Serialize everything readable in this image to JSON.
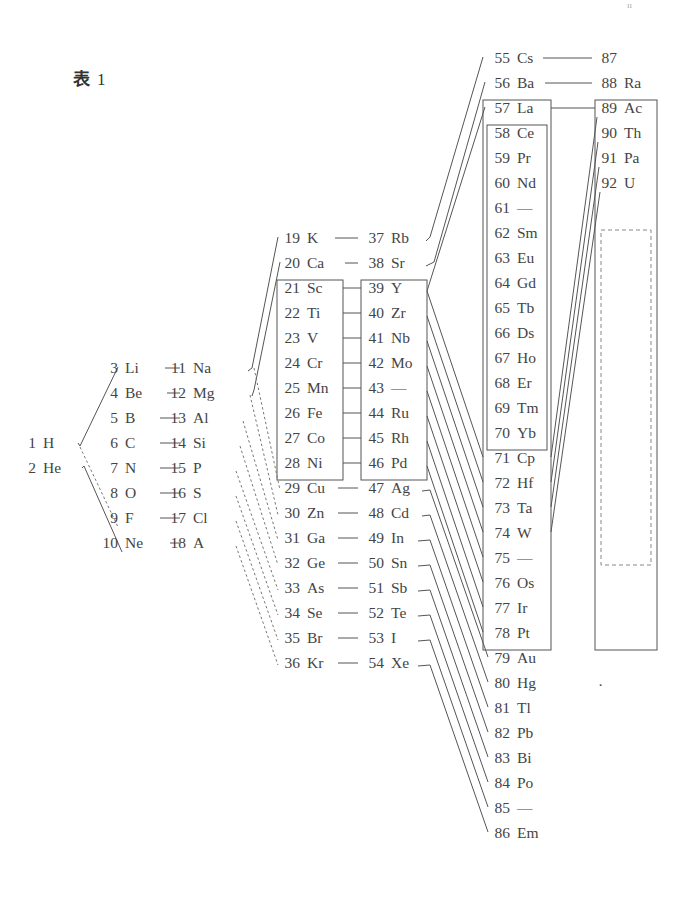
{
  "title": {
    "char": "表",
    "number": "1"
  },
  "page_mark": "ıı",
  "stray_dot": "·",
  "columns": [
    {
      "id": "col1",
      "x": 36,
      "elements": [
        {
          "z": "1",
          "s": "H",
          "y": 448
        },
        {
          "z": "2",
          "s": "He",
          "y": 473
        }
      ]
    },
    {
      "id": "col2",
      "x": 118,
      "elements": [
        {
          "z": "3",
          "s": "Li",
          "y": 373
        },
        {
          "z": "4",
          "s": "Be",
          "y": 398
        },
        {
          "z": "5",
          "s": "B",
          "y": 423
        },
        {
          "z": "6",
          "s": "C",
          "y": 448
        },
        {
          "z": "7",
          "s": "N",
          "y": 473
        },
        {
          "z": "8",
          "s": "O",
          "y": 498
        },
        {
          "z": "9",
          "s": "F",
          "y": 523
        },
        {
          "z": "10",
          "s": "Ne",
          "y": 548
        }
      ]
    },
    {
      "id": "col3",
      "x": 186,
      "elements": [
        {
          "z": "11",
          "s": "Na",
          "y": 373
        },
        {
          "z": "12",
          "s": "Mg",
          "y": 398
        },
        {
          "z": "13",
          "s": "Al",
          "y": 423
        },
        {
          "z": "14",
          "s": "Si",
          "y": 448
        },
        {
          "z": "15",
          "s": "P",
          "y": 473
        },
        {
          "z": "16",
          "s": "S",
          "y": 498
        },
        {
          "z": "17",
          "s": "Cl",
          "y": 523
        },
        {
          "z": "18",
          "s": "A",
          "y": 548
        }
      ]
    },
    {
      "id": "col4",
      "x": 300,
      "elements": [
        {
          "z": "19",
          "s": "K",
          "y": 243
        },
        {
          "z": "20",
          "s": "Ca",
          "y": 268
        },
        {
          "z": "21",
          "s": "Sc",
          "y": 293
        },
        {
          "z": "22",
          "s": "Ti",
          "y": 318
        },
        {
          "z": "23",
          "s": "V",
          "y": 343
        },
        {
          "z": "24",
          "s": "Cr",
          "y": 368
        },
        {
          "z": "25",
          "s": "Mn",
          "y": 393
        },
        {
          "z": "26",
          "s": "Fe",
          "y": 418
        },
        {
          "z": "27",
          "s": "Co",
          "y": 443
        },
        {
          "z": "28",
          "s": "Ni",
          "y": 468
        },
        {
          "z": "29",
          "s": "Cu",
          "y": 493
        },
        {
          "z": "30",
          "s": "Zn",
          "y": 518
        },
        {
          "z": "31",
          "s": "Ga",
          "y": 543
        },
        {
          "z": "32",
          "s": "Ge",
          "y": 568
        },
        {
          "z": "33",
          "s": "As",
          "y": 593
        },
        {
          "z": "34",
          "s": "Se",
          "y": 618
        },
        {
          "z": "35",
          "s": "Br",
          "y": 643
        },
        {
          "z": "36",
          "s": "Kr",
          "y": 668
        }
      ]
    },
    {
      "id": "col5",
      "x": 384,
      "elements": [
        {
          "z": "37",
          "s": "Rb",
          "y": 243
        },
        {
          "z": "38",
          "s": "Sr",
          "y": 268
        },
        {
          "z": "39",
          "s": "Y",
          "y": 293
        },
        {
          "z": "40",
          "s": "Zr",
          "y": 318
        },
        {
          "z": "41",
          "s": "Nb",
          "y": 343
        },
        {
          "z": "42",
          "s": "Mo",
          "y": 368
        },
        {
          "z": "43",
          "s": "—",
          "y": 393
        },
        {
          "z": "44",
          "s": "Ru",
          "y": 418
        },
        {
          "z": "45",
          "s": "Rh",
          "y": 443
        },
        {
          "z": "46",
          "s": "Pd",
          "y": 468
        },
        {
          "z": "47",
          "s": "Ag",
          "y": 493
        },
        {
          "z": "48",
          "s": "Cd",
          "y": 518
        },
        {
          "z": "49",
          "s": "In",
          "y": 543
        },
        {
          "z": "50",
          "s": "Sn",
          "y": 568
        },
        {
          "z": "51",
          "s": "Sb",
          "y": 593
        },
        {
          "z": "52",
          "s": "Te",
          "y": 618
        },
        {
          "z": "53",
          "s": "I",
          "y": 643
        },
        {
          "z": "54",
          "s": "Xe",
          "y": 668
        }
      ]
    },
    {
      "id": "col6",
      "x": 510,
      "elements": [
        {
          "z": "55",
          "s": "Cs",
          "y": 63
        },
        {
          "z": "56",
          "s": "Ba",
          "y": 88
        },
        {
          "z": "57",
          "s": "La",
          "y": 113
        },
        {
          "z": "58",
          "s": "Ce",
          "y": 138
        },
        {
          "z": "59",
          "s": "Pr",
          "y": 163
        },
        {
          "z": "60",
          "s": "Nd",
          "y": 188
        },
        {
          "z": "61",
          "s": "—",
          "y": 213
        },
        {
          "z": "62",
          "s": "Sm",
          "y": 238
        },
        {
          "z": "63",
          "s": "Eu",
          "y": 263
        },
        {
          "z": "64",
          "s": "Gd",
          "y": 288
        },
        {
          "z": "65",
          "s": "Tb",
          "y": 313
        },
        {
          "z": "66",
          "s": "Ds",
          "y": 338
        },
        {
          "z": "67",
          "s": "Ho",
          "y": 363
        },
        {
          "z": "68",
          "s": "Er",
          "y": 388
        },
        {
          "z": "69",
          "s": "Tm",
          "y": 413
        },
        {
          "z": "70",
          "s": "Yb",
          "y": 438
        },
        {
          "z": "71",
          "s": "Cp",
          "y": 463
        },
        {
          "z": "72",
          "s": "Hf",
          "y": 488
        },
        {
          "z": "73",
          "s": "Ta",
          "y": 513
        },
        {
          "z": "74",
          "s": "W",
          "y": 538
        },
        {
          "z": "75",
          "s": "—",
          "y": 563
        },
        {
          "z": "76",
          "s": "Os",
          "y": 588
        },
        {
          "z": "77",
          "s": "Ir",
          "y": 613
        },
        {
          "z": "78",
          "s": "Pt",
          "y": 638
        },
        {
          "z": "79",
          "s": "Au",
          "y": 663
        },
        {
          "z": "80",
          "s": "Hg",
          "y": 688
        },
        {
          "z": "81",
          "s": "Tl",
          "y": 713
        },
        {
          "z": "82",
          "s": "Pb",
          "y": 738
        },
        {
          "z": "83",
          "s": "Bi",
          "y": 763
        },
        {
          "z": "84",
          "s": "Po",
          "y": 788
        },
        {
          "z": "85",
          "s": "—",
          "y": 813
        },
        {
          "z": "86",
          "s": "Em",
          "y": 838
        }
      ]
    },
    {
      "id": "col7",
      "x": 617,
      "elements": [
        {
          "z": "87",
          "s": "",
          "y": 63
        },
        {
          "z": "88",
          "s": "Ra",
          "y": 88
        },
        {
          "z": "89",
          "s": "Ac",
          "y": 113
        },
        {
          "z": "90",
          "s": "Th",
          "y": 138
        },
        {
          "z": "91",
          "s": "Pa",
          "y": 163
        },
        {
          "z": "92",
          "s": "U",
          "y": 188
        }
      ]
    }
  ]
}
